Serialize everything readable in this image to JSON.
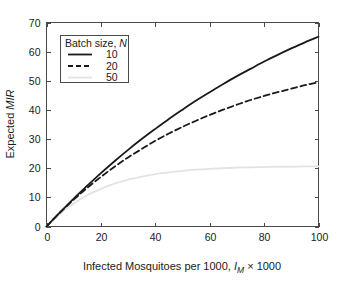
{
  "chart_data": {
    "type": "line",
    "title": "",
    "xlabel": "Infected Mosquitoes per 1000, I_M × 1000",
    "xlabel_parts": {
      "pre": "Infected Mosquitoes per 1000, ",
      "var": "I",
      "sub": "M",
      "post": " × 1000"
    },
    "ylabel": "Expected MIR",
    "ylabel_parts": {
      "pre": "Expected ",
      "ital": "MIR"
    },
    "xlim": [
      0,
      100
    ],
    "ylim": [
      0,
      70
    ],
    "xticks": [
      0,
      20,
      40,
      60,
      80,
      100
    ],
    "yticks": [
      0,
      10,
      20,
      30,
      40,
      50,
      60,
      70
    ],
    "xtick_labels": [
      "0",
      "20",
      "40",
      "60",
      "80",
      "100"
    ],
    "ytick_labels": [
      "0",
      "10",
      "20",
      "30",
      "40",
      "50",
      "60",
      "70"
    ],
    "grid": false,
    "legend_position": "upper-left-inside",
    "legend_title": "Batch size, N",
    "legend_title_parts": {
      "pre": "Batch size, ",
      "ital": "N"
    },
    "x": [
      0,
      5,
      10,
      15,
      20,
      25,
      30,
      35,
      40,
      45,
      50,
      55,
      60,
      65,
      70,
      75,
      80,
      85,
      90,
      95,
      100
    ],
    "series": [
      {
        "name": "10",
        "label": "10",
        "style": "solid",
        "color": "#1a1a1a",
        "width": 1.8,
        "values": [
          0,
          4.9,
          9.6,
          14.0,
          18.3,
          22.4,
          26.3,
          30.0,
          33.5,
          36.9,
          40.1,
          43.2,
          46.1,
          48.9,
          51.6,
          54.1,
          56.6,
          58.9,
          61.1,
          63.2,
          65.1
        ]
      },
      {
        "name": "20",
        "label": "20",
        "style": "dashed",
        "color": "#1a1a1a",
        "width": 1.8,
        "values": [
          0,
          4.8,
          9.2,
          13.3,
          17.0,
          20.5,
          23.7,
          26.6,
          29.4,
          31.9,
          34.2,
          36.3,
          38.3,
          40.1,
          41.8,
          43.4,
          44.8,
          46.1,
          47.3,
          48.5,
          49.5
        ]
      },
      {
        "name": "50",
        "label": "50",
        "style": "solid-light",
        "color": "#e3e3e3",
        "width": 1.8,
        "values": [
          0,
          4.4,
          7.9,
          10.7,
          12.9,
          14.7,
          16.1,
          17.1,
          18.0,
          18.6,
          19.1,
          19.5,
          19.8,
          20.0,
          20.2,
          20.3,
          20.4,
          20.5,
          20.5,
          20.6,
          20.6
        ]
      }
    ]
  },
  "legend": {
    "title": "Batch size, N",
    "entries": [
      {
        "label": "10",
        "style": "solid"
      },
      {
        "label": "20",
        "style": "dashed"
      },
      {
        "label": "50",
        "style": "solid-light"
      }
    ]
  },
  "colors": {
    "axis": "#4a4a4a",
    "text": "#1a1a1a",
    "series_dark": "#1a1a1a",
    "series_light": "#e3e3e3",
    "background": "#ffffff"
  }
}
